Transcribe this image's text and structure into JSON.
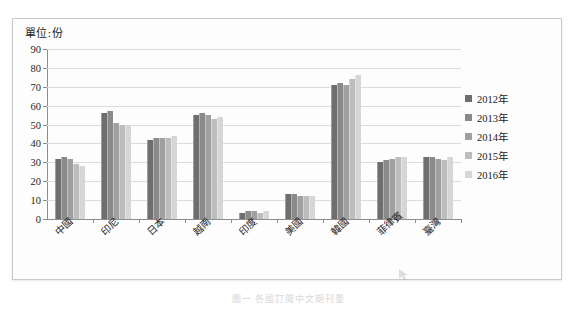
{
  "chart": {
    "unit_label": "單位:份",
    "caption": "圖一 各國訂閱中文期刊量"
  },
  "chart_data": {
    "type": "bar",
    "title": "",
    "subtitle": "",
    "xlabel": "",
    "ylabel": "單位:份",
    "ylim": [
      0,
      90
    ],
    "yticks": [
      0,
      10,
      20,
      30,
      40,
      50,
      60,
      70,
      80,
      90
    ],
    "grid": true,
    "legend_position": "right",
    "categories": [
      "中國",
      "印尼",
      "日本",
      "越南",
      "印度",
      "美國",
      "韓國",
      "菲律賓",
      "臺灣"
    ],
    "series": [
      {
        "name": "2012年",
        "color": "#6e6e6e",
        "values": [
          32,
          56,
          42,
          55,
          3,
          13,
          71,
          30,
          33
        ]
      },
      {
        "name": "2013年",
        "color": "#8a8a8a",
        "values": [
          33,
          57,
          43,
          56,
          4,
          13,
          72,
          31,
          33
        ]
      },
      {
        "name": "2014年",
        "color": "#a0a0a0",
        "values": [
          32,
          51,
          43,
          55,
          4,
          12,
          71,
          32,
          32
        ]
      },
      {
        "name": "2015年",
        "color": "#bdbdbd",
        "values": [
          29,
          50,
          43,
          53,
          3,
          12,
          74,
          33,
          31
        ]
      },
      {
        "name": "2016年",
        "color": "#d6d6d6",
        "values": [
          28,
          50,
          44,
          54,
          4,
          12,
          76,
          33,
          33
        ]
      }
    ]
  }
}
